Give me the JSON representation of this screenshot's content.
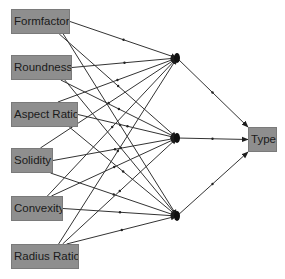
{
  "diagram": {
    "type": "neural-network",
    "colors": {
      "node_fill": "#8e8e8e",
      "node_border": "#7a7a7a",
      "edge": "#333333",
      "text": "#1a1a1a"
    },
    "input_nodes": [
      {
        "id": "in0",
        "label": "Formfactor",
        "x": 11,
        "y": 9,
        "w": 59,
        "h": 25
      },
      {
        "id": "in1",
        "label": "Roundness",
        "x": 11,
        "y": 55,
        "w": 61,
        "h": 25
      },
      {
        "id": "in2",
        "label": "Aspect Ratio",
        "x": 11,
        "y": 102,
        "w": 67,
        "h": 25
      },
      {
        "id": "in3",
        "label": "Solidity",
        "x": 11,
        "y": 148,
        "w": 42,
        "h": 25
      },
      {
        "id": "in4",
        "label": "Convexity",
        "x": 11,
        "y": 196,
        "w": 52,
        "h": 25
      },
      {
        "id": "in5",
        "label": "Radius Ratio",
        "x": 11,
        "y": 244,
        "w": 68,
        "h": 25
      }
    ],
    "hidden_nodes": [
      {
        "id": "h0",
        "x": 177,
        "y": 58
      },
      {
        "id": "h1",
        "x": 177,
        "y": 138
      },
      {
        "id": "h2",
        "x": 177,
        "y": 216
      }
    ],
    "output_nodes": [
      {
        "id": "out0",
        "label": "Type",
        "x": 248,
        "y": 127,
        "w": 29,
        "h": 25
      }
    ],
    "connections": "fully-connected: each input to each hidden node; each hidden node to output"
  }
}
